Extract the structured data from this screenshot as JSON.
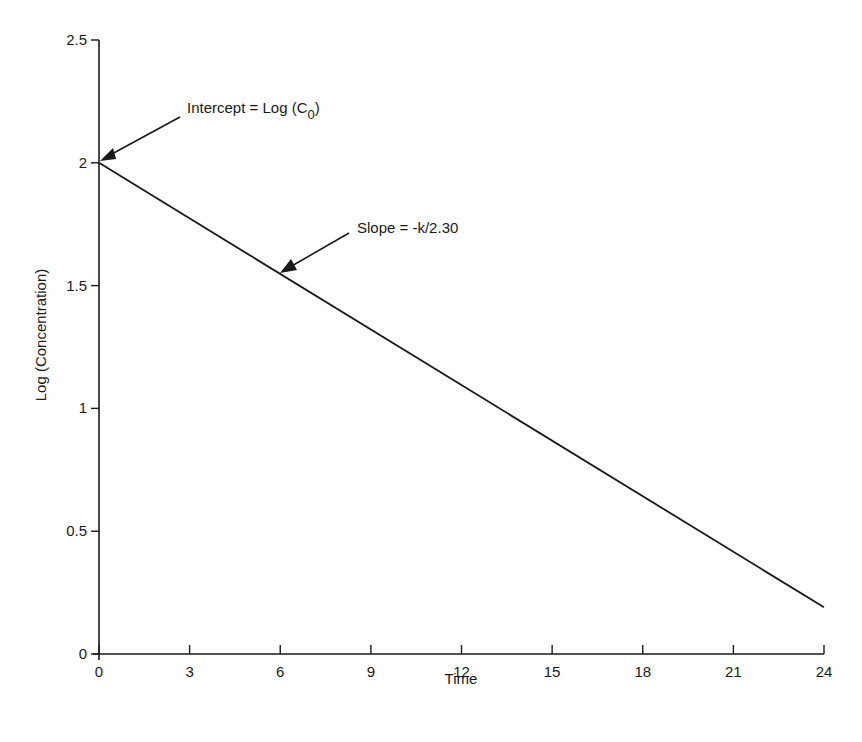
{
  "chart_data": {
    "type": "line",
    "title": "",
    "xlabel": "Time",
    "ylabel": "Log (Concentration)",
    "xlim": [
      0,
      24
    ],
    "ylim": [
      0,
      2.5
    ],
    "x_ticks": [
      0,
      3,
      6,
      9,
      12,
      15,
      18,
      21,
      24
    ],
    "y_ticks": [
      0,
      0.5,
      1,
      1.5,
      2,
      2.5
    ],
    "y_tick_labels": [
      "0",
      "0.5",
      "1",
      "1.5",
      "2",
      "2.5"
    ],
    "grid": false,
    "legend": null,
    "series": [
      {
        "name": "Log (Concentration)",
        "x": [
          0,
          24
        ],
        "y": [
          2.0,
          0.19
        ]
      }
    ],
    "annotations": [
      {
        "text_main": "Intercept = Log (C",
        "subscript": "0",
        "text_close": ")",
        "points_to": [
          0,
          2.0
        ]
      },
      {
        "text": "Slope = -k/2.30",
        "points_to": [
          6,
          1.55
        ]
      }
    ]
  },
  "colors": {
    "ink": "#1a1a1a",
    "background": "#ffffff"
  }
}
